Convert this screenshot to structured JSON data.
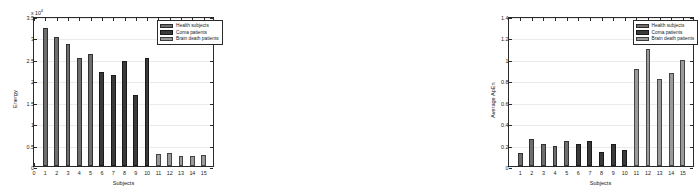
{
  "colors": {
    "healthy": "#6e6e6e",
    "coma": "#3a3a3a",
    "brain_death": "#9a9a9a",
    "axis": "#2a2a2a",
    "grid": "#eceaea",
    "background": "#ffffff"
  },
  "legend": {
    "entries": [
      {
        "label": "Health subjects",
        "group": "healthy"
      },
      {
        "label": "Coma patients",
        "group": "coma"
      },
      {
        "label": "Brain death patients",
        "group": "brain_death"
      }
    ]
  },
  "chart_data": [
    {
      "type": "bar",
      "title": "",
      "xlabel": "Subjects",
      "ylabel": "Energy",
      "y_exponent_label": "x 10",
      "y_exponent_power": "4",
      "y_scale": 10000,
      "xlim": [
        0,
        16
      ],
      "ylim": [
        0,
        35000
      ],
      "grid": true,
      "legend_position": "top-right",
      "xticks": [
        "0",
        "1",
        "2",
        "3",
        "4",
        "5",
        "6",
        "7",
        "8",
        "9",
        "10",
        "11",
        "12",
        "13",
        "14",
        "15"
      ],
      "yticks": [
        "0",
        "0.5",
        "1",
        "1.5",
        "2",
        "2.5",
        "3",
        "3.5"
      ],
      "ytick_values": [
        0,
        5000,
        10000,
        15000,
        20000,
        25000,
        30000,
        35000
      ],
      "categories": [
        "1",
        "2",
        "3",
        "4",
        "5",
        "6",
        "7",
        "8",
        "9",
        "10",
        "11",
        "12",
        "13",
        "14",
        "15"
      ],
      "values": [
        32100,
        30000,
        28400,
        25100,
        26200,
        22000,
        21200,
        24400,
        16600,
        25200,
        2900,
        3050,
        2300,
        2350,
        2500
      ],
      "groups": [
        "healthy",
        "healthy",
        "healthy",
        "healthy",
        "healthy",
        "coma",
        "coma",
        "coma",
        "coma",
        "coma",
        "brain_death",
        "brain_death",
        "brain_death",
        "brain_death",
        "brain_death"
      ]
    },
    {
      "type": "bar",
      "title": "",
      "xlabel": "Subjects",
      "ylabel": "Average ApEn",
      "xlim": [
        0,
        16
      ],
      "ylim": [
        0,
        1.4
      ],
      "grid": true,
      "legend_position": "top-right",
      "xticks": [
        "1",
        "2",
        "3",
        "4",
        "5",
        "6",
        "7",
        "8",
        "9",
        "10",
        "11",
        "12",
        "13",
        "14",
        "15"
      ],
      "yticks": [
        "0",
        "0.2",
        "0.4",
        "0.6",
        "0.8",
        "1",
        "1.2",
        "1.4"
      ],
      "ytick_values": [
        0,
        0.2,
        0.4,
        0.6,
        0.8,
        1.0,
        1.2,
        1.4
      ],
      "categories": [
        "1",
        "2",
        "3",
        "4",
        "5",
        "6",
        "7",
        "8",
        "9",
        "10",
        "11",
        "12",
        "13",
        "14",
        "15"
      ],
      "values": [
        0.12,
        0.25,
        0.21,
        0.19,
        0.235,
        0.21,
        0.23,
        0.13,
        0.205,
        0.145,
        0.905,
        1.09,
        0.815,
        0.865,
        0.985
      ],
      "groups": [
        "healthy",
        "healthy",
        "healthy",
        "healthy",
        "healthy",
        "coma",
        "coma",
        "coma",
        "coma",
        "coma",
        "brain_death",
        "brain_death",
        "brain_death",
        "brain_death",
        "brain_death"
      ]
    }
  ]
}
